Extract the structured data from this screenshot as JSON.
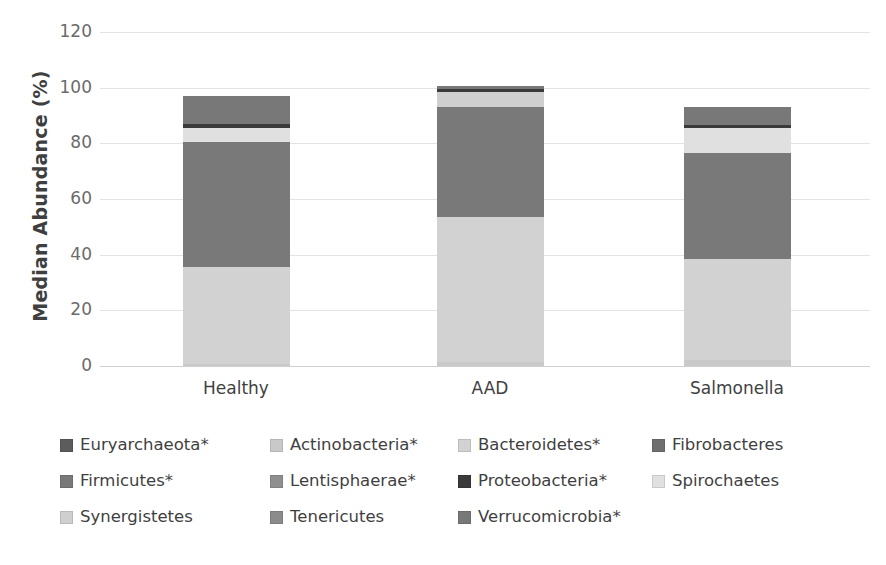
{
  "chart_data": {
    "type": "bar",
    "subtype": "stacked-bar",
    "title": "",
    "xlabel": "",
    "ylabel": "Median Abundance (%)",
    "ylim": [
      0,
      120
    ],
    "yticks": [
      0,
      20,
      40,
      60,
      80,
      100,
      120
    ],
    "ytick_labels": [
      "0",
      "20",
      "40",
      "60",
      "80",
      "100",
      "120"
    ],
    "grid": true,
    "legend_position": "bottom",
    "categories": [
      "Healthy",
      "AAD",
      "Salmonella"
    ],
    "series": [
      {
        "name": "Euryarchaeota*",
        "label": "Euryarchaeota*",
        "color": "#5c5c5c",
        "values": [
          0.0,
          0.0,
          0.0
        ]
      },
      {
        "name": "Actinobacteria*",
        "label": "Actinobacteria*",
        "color": "#c9c9c9",
        "values": [
          0.8,
          1.5,
          2.3
        ]
      },
      {
        "name": "Bacteroidetes*",
        "label": "Bacteroidetes*",
        "color": "#d2d2d2",
        "values": [
          34.7,
          52.0,
          36.2
        ]
      },
      {
        "name": "Fibrobacteres",
        "label": "Fibrobacteres",
        "color": "#6f6f6f",
        "values": [
          0.0,
          0.0,
          0.0
        ]
      },
      {
        "name": "Firmicutes*",
        "label": "Firmicutes*",
        "color": "#797979",
        "values": [
          45.0,
          39.5,
          38.0
        ]
      },
      {
        "name": "Lentisphaerae*",
        "label": "Lentisphaerae*",
        "color": "#8f8f8f",
        "values": [
          0.0,
          0.0,
          0.0
        ]
      },
      {
        "name": "Proteobacteria*",
        "label": "Proteobacteria*",
        "color": "#3a3a3a",
        "values": [
          1.5,
          1.0,
          1.0
        ]
      },
      {
        "name": "Spirochaetes",
        "label": "Spirochaetes",
        "color": "#e0e0e0",
        "values": [
          5.0,
          0.0,
          9.0
        ]
      },
      {
        "name": "Synergistetes",
        "label": "Synergistetes",
        "color": "#cfcfcf",
        "values": [
          0.0,
          5.5,
          0.0
        ]
      },
      {
        "name": "Tenericutes",
        "label": "Tenericutes",
        "color": "#8b8b8b",
        "values": [
          0.0,
          0.0,
          0.0
        ]
      },
      {
        "name": "Verrucomicrobia*",
        "label": "Verrucomicrobia*",
        "color": "#787878",
        "values": [
          10.0,
          1.0,
          6.5
        ]
      }
    ],
    "stack_order": [
      "Actinobacteria*",
      "Bacteroidetes*",
      "Firmicutes*",
      "Spirochaetes",
      "Synergistetes",
      "Proteobacteria*",
      "Verrucomicrobia*"
    ],
    "bar_totals": [
      97.0,
      100.5,
      93.0
    ],
    "footnote": "* denotes significance"
  },
  "legend": {
    "rows": [
      [
        {
          "label": "Euryarchaeota*",
          "color": "#5c5c5c",
          "left": 0,
          "name": "euryarchaeota"
        },
        {
          "label": "Actinobacteria*",
          "color": "#c9c9c9",
          "left": 210,
          "name": "actinobacteria"
        },
        {
          "label": "Bacteroidetes*",
          "color": "#d2d2d2",
          "left": 398,
          "name": "bacteroidetes"
        },
        {
          "label": "Fibrobacteres",
          "color": "#6f6f6f",
          "left": 592,
          "name": "fibrobacteres"
        }
      ],
      [
        {
          "label": "Firmicutes*",
          "color": "#797979",
          "left": 0,
          "name": "firmicutes"
        },
        {
          "label": "Lentisphaerae*",
          "color": "#8f8f8f",
          "left": 210,
          "name": "lentisphaerae"
        },
        {
          "label": "Proteobacteria*",
          "color": "#3a3a3a",
          "left": 398,
          "name": "proteobacteria"
        },
        {
          "label": "Spirochaetes",
          "color": "#e0e0e0",
          "left": 592,
          "name": "spirochaetes"
        }
      ],
      [
        {
          "label": "Synergistetes",
          "color": "#cfcfcf",
          "left": 0,
          "name": "synergistetes"
        },
        {
          "label": "Tenericutes",
          "color": "#8b8b8b",
          "left": 210,
          "name": "tenericutes"
        },
        {
          "label": "Verrucomicrobia*",
          "color": "#787878",
          "left": 398,
          "name": "verrucomicrobia"
        }
      ]
    ]
  }
}
